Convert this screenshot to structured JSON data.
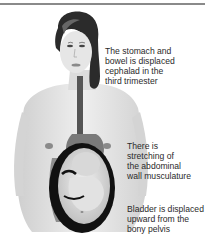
{
  "figure": {
    "captions": [
      {
        "id": "stomach",
        "lines": [
          "The stomach and",
          "bowel is displaced",
          "cephalad in the",
          "third trimester"
        ]
      },
      {
        "id": "abdominal",
        "lines": [
          "There is",
          "stretching of",
          "the abdominal",
          "wall musculature"
        ]
      },
      {
        "id": "bladder",
        "lines": [
          "Bladder is displaced",
          "upward from the",
          "bony pelvis"
        ]
      }
    ]
  },
  "colors": {
    "rule": "#8a8a8a",
    "skin": "#e4e4e4",
    "hair": "#2b2b2b",
    "esophagus": "#555555",
    "uterus_wall": "#111111",
    "text": "#2a2a2a"
  }
}
